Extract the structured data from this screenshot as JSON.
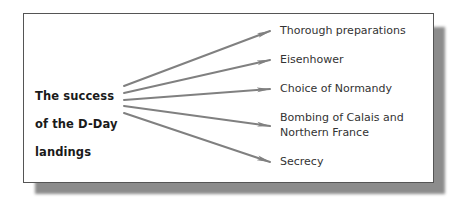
{
  "diagram": {
    "type": "spider / one-to-many arrow diagram",
    "source_label": {
      "lines": [
        "The success",
        "of the D-Day",
        "landings"
      ]
    },
    "factors": [
      {
        "lines": [
          "Thorough preparations"
        ]
      },
      {
        "lines": [
          "Eisenhower"
        ]
      },
      {
        "lines": [
          "Choice of Normandy"
        ]
      },
      {
        "lines": [
          "Bombing of Calais and",
          "Northern France"
        ]
      },
      {
        "lines": [
          "Secrecy"
        ]
      }
    ],
    "colors": {
      "arrow": "#808080",
      "frame_border": "#555555",
      "shadow": "#8c8c8c",
      "source_text": "#1a1a1a",
      "factor_text": "#333333",
      "background": "#ffffff"
    }
  }
}
